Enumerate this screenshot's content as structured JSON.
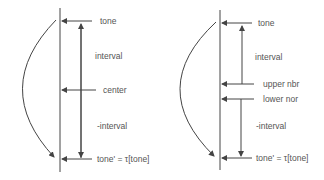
{
  "colors": {
    "line": "#444444",
    "text": "#555555",
    "background": "#ffffff"
  },
  "left_diagram": {
    "labels": {
      "top": "tone",
      "interval": "interval",
      "center": "center",
      "neg_interval": "-interval",
      "bottom": "tone' = τ[tone]"
    }
  },
  "right_diagram": {
    "labels": {
      "top": "tone",
      "interval": "interval",
      "upper": "upper nbr",
      "lower": "lower nor",
      "neg_interval": "-interval",
      "bottom": "tone' = τ[tone]"
    }
  }
}
